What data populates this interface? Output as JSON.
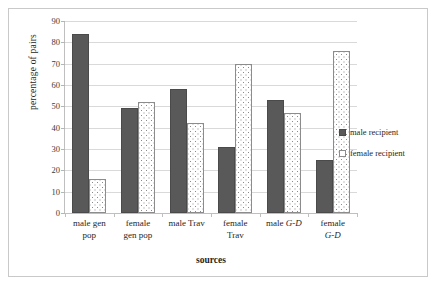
{
  "chart_data": {
    "type": "bar",
    "title": "",
    "xlabel": "sources",
    "ylabel": "percentage of pairs",
    "ylim": [
      0,
      90
    ],
    "ytick_step": 10,
    "yticks": [
      "0",
      "10",
      "20",
      "30",
      "40",
      "50",
      "60",
      "70",
      "80",
      "90"
    ],
    "grid": true,
    "legend_position": "right",
    "categories": [
      "male gen pop",
      "female gen pop",
      "male Trav",
      "female Trav",
      "male G-D",
      "female G-D"
    ],
    "categories_lines": [
      [
        "male gen",
        "pop"
      ],
      [
        "female",
        "gen pop"
      ],
      [
        "male Trav",
        ""
      ],
      [
        "female",
        "Trav"
      ],
      [
        "male G-D",
        ""
      ],
      [
        "female",
        "G-D"
      ]
    ],
    "series": [
      {
        "name": "male recipient",
        "color": "#595959",
        "pattern": "solid",
        "values": [
          84,
          49,
          58,
          31,
          53,
          25
        ]
      },
      {
        "name": "female recipient",
        "color": "#ffffff",
        "pattern": "dotted",
        "values": [
          16,
          52,
          42,
          70,
          47,
          76
        ]
      }
    ]
  },
  "legend": {
    "items": [
      {
        "label": "male recipient"
      },
      {
        "label": "female recipient"
      }
    ]
  },
  "axis": {
    "y_title": "percentage of pairs",
    "x_title": "sources"
  }
}
